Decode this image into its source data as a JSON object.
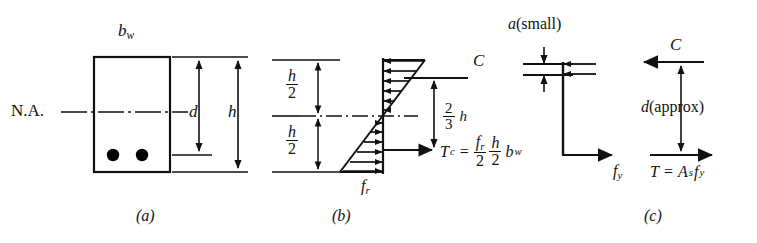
{
  "figure": {
    "type": "engineering-diagram",
    "panels": [
      {
        "id": "a",
        "caption": "(a)",
        "name": "beam-cross-section",
        "labels": {
          "width": "b",
          "width_sub": "w",
          "neutral_axis": "N.A.",
          "effective_depth": "d",
          "total_depth": "h"
        },
        "rebar_count": 2
      },
      {
        "id": "b",
        "caption": "(b)",
        "name": "cracking-stress-distribution",
        "labels": {
          "half_depth_num": "h",
          "half_depth_den": "2",
          "compression_force": "C",
          "lever_arm_num": "2",
          "lever_arm_den": "3",
          "lever_arm_var": "h",
          "tension_force": "T",
          "tension_force_sub": "c",
          "modulus_of_rupture": "f",
          "modulus_of_rupture_sub": "r"
        },
        "equation": {
          "lhs": "T",
          "lhs_sub": "c",
          "eq": "=",
          "f1_num": "f",
          "f1_num_sub": "r",
          "f1_den": "2",
          "f2_num": "h",
          "f2_den": "2",
          "tail": "b",
          "tail_sub": "w"
        }
      },
      {
        "id": "c",
        "caption": "(c)",
        "name": "ultimate-strength-stress-block",
        "labels": {
          "block_depth": "a",
          "block_depth_note": "(small)",
          "steel_stress": "f",
          "steel_stress_sub": "y",
          "compression_force": "C",
          "lever_arm": "d",
          "lever_arm_note": "(approx)",
          "tension_equation_lhs": "T",
          "tension_equation_eq": "=",
          "tension_equation_area": "A",
          "tension_equation_area_sub": "s",
          "tension_equation_stress": "f",
          "tension_equation_stress_sub": "y"
        }
      }
    ],
    "colors": {
      "line": "#111111",
      "background": "#ffffff",
      "rebar_fill": "#000000"
    }
  }
}
